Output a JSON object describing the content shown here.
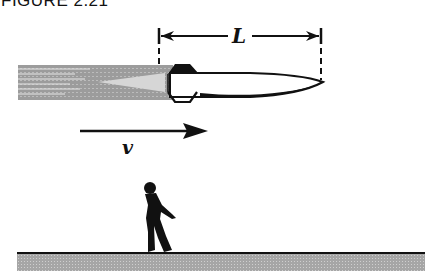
{
  "figure": {
    "title": "FIGURE 2.21",
    "length_label": "L",
    "velocity_label": "v"
  },
  "elements": {
    "rocket": "rocket-with-exhaust-plume",
    "velocity_arrow": "arrow-pointing-right",
    "observer": "standing-person-silhouette",
    "ground": "hatched-ground-strip"
  },
  "colors": {
    "ink": "#111111",
    "exhaust": "#9a9a9a",
    "exhaust_core": "#d4d4d4",
    "ground": "#a8a8a8",
    "background": "#ffffff"
  }
}
